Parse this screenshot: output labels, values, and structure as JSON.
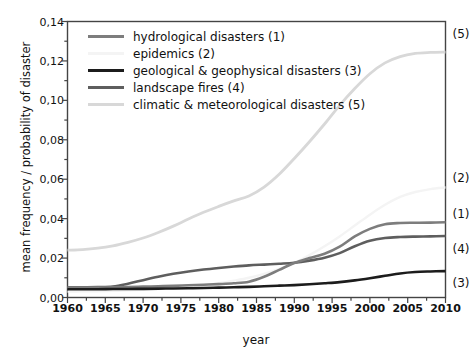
{
  "chart_data": {
    "type": "line",
    "title": "",
    "xlabel": "year",
    "ylabel": "mean frequency / probability of disaster",
    "xlim": [
      1960,
      2010
    ],
    "ylim": [
      0.0,
      0.14
    ],
    "grid": false,
    "legend_position": "top-left",
    "decimal_separator": ",",
    "x_tick_labels": [
      "1960",
      "1965",
      "1970",
      "1975",
      "1980",
      "1985",
      "1990",
      "1995",
      "2000",
      "2005",
      "2010"
    ],
    "x_ticks": [
      1960,
      1965,
      1970,
      1975,
      1980,
      1985,
      1990,
      1995,
      2000,
      2005,
      2010
    ],
    "x_minor_step": 2.5,
    "y_tick_labels": [
      "0,00",
      "0,02",
      "0,04",
      "0,06",
      "0,08",
      "0,10",
      "0,12",
      "0,14"
    ],
    "y_ticks": [
      0.0,
      0.02,
      0.04,
      0.06,
      0.08,
      0.1,
      0.12,
      0.14
    ],
    "y_minor_step": 0.01,
    "x": [
      1960,
      1962,
      1964,
      1966,
      1968,
      1970,
      1972,
      1974,
      1976,
      1978,
      1980,
      1982,
      1984,
      1986,
      1988,
      1990,
      1992,
      1994,
      1996,
      1998,
      2000,
      2002,
      2004,
      2006,
      2008,
      2010
    ],
    "series": [
      {
        "name": "hydrological disasters (1)",
        "key": "1",
        "color": "#7d7d7d",
        "width": 2.6,
        "callout": "(1)",
        "callout_value": 0.0425,
        "values": [
          0.005,
          0.005,
          0.0051,
          0.0052,
          0.0053,
          0.0055,
          0.0057,
          0.0059,
          0.0062,
          0.0065,
          0.0068,
          0.0072,
          0.008,
          0.0105,
          0.014,
          0.0175,
          0.02,
          0.0222,
          0.0258,
          0.031,
          0.0348,
          0.0372,
          0.0378,
          0.0379,
          0.038,
          0.0382
        ]
      },
      {
        "name": "epidemics (2)",
        "key": "2",
        "color": "#f4f4f4",
        "width": 2.4,
        "callout": "(2)",
        "callout_value": 0.0605,
        "values": [
          0.003,
          0.0031,
          0.0032,
          0.0034,
          0.0036,
          0.0039,
          0.0043,
          0.0048,
          0.0054,
          0.0062,
          0.0072,
          0.0085,
          0.01,
          0.012,
          0.0145,
          0.0175,
          0.0215,
          0.026,
          0.031,
          0.0365,
          0.042,
          0.047,
          0.051,
          0.0535,
          0.055,
          0.0558
        ]
      },
      {
        "name": "geological & geophysical disasters (3)",
        "key": "3",
        "color": "#1c1c1c",
        "width": 2.6,
        "callout": "(3)",
        "callout_value": 0.0075,
        "values": [
          0.0042,
          0.0042,
          0.0042,
          0.0043,
          0.0043,
          0.0044,
          0.0045,
          0.0046,
          0.0047,
          0.0048,
          0.005,
          0.0052,
          0.0054,
          0.0057,
          0.006,
          0.0063,
          0.0067,
          0.0072,
          0.0078,
          0.0087,
          0.0098,
          0.011,
          0.0122,
          0.0129,
          0.0132,
          0.0134
        ]
      },
      {
        "name": "landscape fires (4)",
        "key": "4",
        "color": "#5e5e5e",
        "width": 2.6,
        "callout": "(4)",
        "callout_value": 0.0248,
        "values": [
          0.0052,
          0.0052,
          0.0053,
          0.0056,
          0.007,
          0.0088,
          0.0105,
          0.012,
          0.0132,
          0.0142,
          0.015,
          0.0157,
          0.0163,
          0.0167,
          0.0171,
          0.0176,
          0.0187,
          0.0202,
          0.0225,
          0.026,
          0.0288,
          0.0302,
          0.0307,
          0.0309,
          0.031,
          0.0312
        ]
      },
      {
        "name": "climatic & meteorological disasters (5)",
        "key": "5",
        "color": "#d8d8d8",
        "width": 2.8,
        "callout": "(5)",
        "callout_value": 0.1335,
        "values": [
          0.024,
          0.0243,
          0.025,
          0.0262,
          0.028,
          0.0302,
          0.033,
          0.0362,
          0.0398,
          0.0432,
          0.0462,
          0.049,
          0.0515,
          0.056,
          0.0625,
          0.0705,
          0.079,
          0.088,
          0.0975,
          0.106,
          0.1135,
          0.119,
          0.1222,
          0.1238,
          0.1243,
          0.1245
        ]
      }
    ]
  },
  "axes": {
    "frame_color": "#444444",
    "tick_color": "#444444"
  }
}
